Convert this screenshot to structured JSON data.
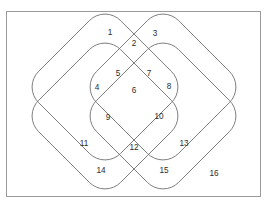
{
  "figure": {
    "kind": "four-set-venn-diagram",
    "title": "",
    "frame": {
      "border_color": "#9a9a9a",
      "background_color": "#ffffff",
      "x": 6,
      "y": 11,
      "width": 255,
      "height": 186
    },
    "stroke_color": "#6f6f6f",
    "label_color": "#2b2b2b"
  },
  "shapes": [
    {
      "name": "set-a-outer-upper-left",
      "cx": 105,
      "cy": 87,
      "half": 58,
      "radius": 22,
      "rotation": 45
    },
    {
      "name": "set-b-outer-upper-right",
      "cx": 163,
      "cy": 87,
      "half": 58,
      "radius": 22,
      "rotation": 45
    },
    {
      "name": "set-c-inner-lower-left",
      "cx": 105,
      "cy": 116,
      "half": 58,
      "radius": 22,
      "rotation": 45
    },
    {
      "name": "set-d-inner-lower-right",
      "cx": 163,
      "cy": 116,
      "half": 58,
      "radius": 22,
      "rotation": 45
    }
  ],
  "regions": [
    {
      "id": 1,
      "label": "1",
      "x": 110,
      "y": 33
    },
    {
      "id": 2,
      "label": "2",
      "x": 134,
      "y": 44
    },
    {
      "id": 3,
      "label": "3",
      "x": 155,
      "y": 34
    },
    {
      "id": 4,
      "label": "4",
      "x": 97,
      "y": 88
    },
    {
      "id": 5,
      "label": "5",
      "x": 118,
      "y": 74
    },
    {
      "id": 6,
      "label": "6",
      "x": 134,
      "y": 91
    },
    {
      "id": 7,
      "label": "7",
      "x": 149,
      "y": 74
    },
    {
      "id": 8,
      "label": "8",
      "x": 169,
      "y": 87
    },
    {
      "id": 9,
      "label": "9",
      "x": 108,
      "y": 118
    },
    {
      "id": 10,
      "label": "10",
      "x": 159,
      "y": 117
    },
    {
      "id": 11,
      "label": "11",
      "x": 84,
      "y": 144
    },
    {
      "id": 12,
      "label": "12",
      "x": 134,
      "y": 148
    },
    {
      "id": 13,
      "label": "13",
      "x": 184,
      "y": 144
    },
    {
      "id": 14,
      "label": "14",
      "x": 101,
      "y": 171
    },
    {
      "id": 15,
      "label": "15",
      "x": 164,
      "y": 171
    },
    {
      "id": 16,
      "label": "16",
      "x": 214,
      "y": 174
    }
  ]
}
